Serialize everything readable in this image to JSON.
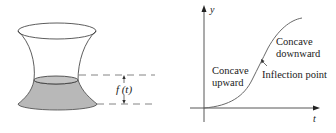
{
  "left_figure": {
    "description": "hourglass-shaped vessel partially filled with liquid",
    "height_label": "f (t)",
    "fill_color": "#b8b8b8",
    "stroke_color": "#333333",
    "dash_color": "#666666"
  },
  "right_figure": {
    "y_axis_label": "y",
    "x_axis_label": "t",
    "curve_color": "#6a6a6a",
    "annotations": {
      "concave_down_line1": "Concave",
      "concave_down_line2": "downward",
      "concave_up_line1": "Concave",
      "concave_up_line2": "upward",
      "inflection": "Inflection point"
    }
  }
}
